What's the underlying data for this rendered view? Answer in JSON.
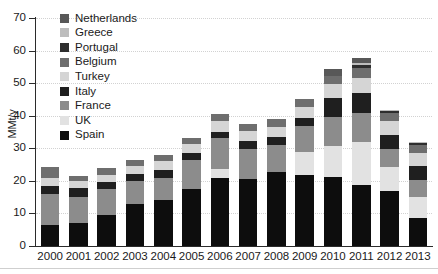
{
  "chart_data": {
    "type": "bar",
    "stacked": true,
    "title": "",
    "xlabel": "",
    "ylabel": "MMt/y",
    "ylim": [
      0,
      70
    ],
    "ytick_step": 10,
    "yticks": [
      0,
      10,
      20,
      30,
      40,
      50,
      60,
      70
    ],
    "grid": true,
    "grid_style": "dotted-horizontal",
    "legend_position": "upper-left-inside",
    "categories": [
      "2000",
      "2001",
      "2002",
      "2003",
      "2004",
      "2005",
      "2006",
      "2007",
      "2008",
      "2009",
      "2010",
      "2011",
      "2012",
      "2013"
    ],
    "series": [
      {
        "name": "Spain",
        "color": "#0d0d0d",
        "values": [
          6.5,
          7.0,
          9.6,
          12.8,
          14.0,
          17.6,
          20.8,
          20.7,
          22.6,
          21.8,
          21.3,
          18.6,
          16.8,
          8.6
        ]
      },
      {
        "name": "UK",
        "color": "#e2e2e2",
        "values": [
          0.0,
          0.0,
          0.0,
          0.0,
          0.0,
          0.0,
          2.9,
          0.0,
          0.0,
          7.0,
          9.5,
          13.2,
          7.6,
          6.3
        ]
      },
      {
        "name": "France",
        "color": "#8c8c8c",
        "values": [
          9.4,
          7.9,
          7.9,
          7.1,
          7.0,
          8.7,
          9.4,
          9.0,
          8.5,
          8.2,
          8.9,
          9.0,
          5.4,
          5.4
        ]
      },
      {
        "name": "Italy",
        "color": "#1f1f1f",
        "values": [
          2.5,
          3.0,
          2.2,
          2.2,
          2.3,
          2.3,
          2.0,
          2.4,
          2.4,
          2.4,
          5.6,
          6.2,
          4.2,
          4.3
        ]
      },
      {
        "name": "Turkey",
        "color": "#d5d5d5",
        "values": [
          2.4,
          2.1,
          2.2,
          2.5,
          2.7,
          2.6,
          3.3,
          3.2,
          3.1,
          3.2,
          4.4,
          4.7,
          4.3,
          4.0
        ]
      },
      {
        "name": "Belgium",
        "color": "#6e6e6e",
        "values": [
          3.6,
          1.5,
          2.0,
          1.9,
          1.9,
          2.1,
          2.3,
          2.2,
          2.4,
          2.6,
          2.6,
          3.1,
          2.4,
          2.3
        ]
      },
      {
        "name": "Portugal",
        "color": "#2e2e2e",
        "values": [
          0.0,
          0.0,
          0.0,
          0.0,
          0.0,
          0.0,
          0.0,
          0.0,
          0.0,
          0.0,
          0.0,
          0.9,
          0.7,
          0.6
        ]
      },
      {
        "name": "Greece",
        "color": "#bdbdbd",
        "values": [
          0.0,
          0.0,
          0.0,
          0.0,
          0.0,
          0.0,
          0.0,
          0.0,
          0.0,
          0.0,
          0.0,
          0.5,
          0.5,
          0.4
        ]
      },
      {
        "name": "Netherlands",
        "color": "#585858",
        "values": [
          0.0,
          0.0,
          0.0,
          0.0,
          0.0,
          0.0,
          0.0,
          0.0,
          0.0,
          0.0,
          2.0,
          1.4,
          0.0,
          0.0
        ]
      }
    ],
    "legend_order": [
      "Netherlands",
      "Greece",
      "Portugal",
      "Belgium",
      "Turkey",
      "Italy",
      "France",
      "UK",
      "Spain"
    ]
  },
  "legend": {
    "items": [
      {
        "label": "Netherlands",
        "color": "#585858"
      },
      {
        "label": "Greece",
        "color": "#bdbdbd"
      },
      {
        "label": "Portugal",
        "color": "#2e2e2e"
      },
      {
        "label": "Belgium",
        "color": "#6e6e6e"
      },
      {
        "label": "Turkey",
        "color": "#d5d5d5"
      },
      {
        "label": "Italy",
        "color": "#1f1f1f"
      },
      {
        "label": "France",
        "color": "#8c8c8c"
      },
      {
        "label": "UK",
        "color": "#e2e2e2"
      },
      {
        "label": "Spain",
        "color": "#0d0d0d"
      }
    ]
  },
  "axes": {
    "y_label": "MMt/y",
    "y_ticks": [
      "0",
      "10",
      "20",
      "30",
      "40",
      "50",
      "60",
      "70"
    ],
    "x_ticks": [
      "2000",
      "2001",
      "2002",
      "2003",
      "2004",
      "2005",
      "2006",
      "2007",
      "2008",
      "2009",
      "2010",
      "2011",
      "2012",
      "2013"
    ]
  }
}
